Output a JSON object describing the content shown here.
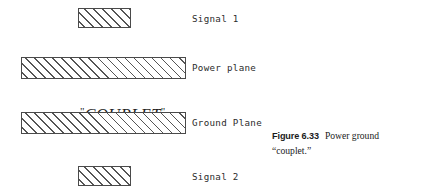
{
  "figure": {
    "layers": [
      {
        "name": "signal-1",
        "label": "Signal 1",
        "fill": "diagonal-hatch",
        "x": 78,
        "y": 8,
        "width": 53,
        "height": 20,
        "label_x": 192,
        "label_y": 13
      },
      {
        "name": "power-plane",
        "label": "Power plane",
        "fill": "diagonal-hatch",
        "x": 21,
        "y": 57,
        "width": 165,
        "height": 22,
        "label_x": 192,
        "label_y": 62
      },
      {
        "name": "ground-plane",
        "label": "Ground Plane",
        "fill": "diagonal-hatch",
        "x": 21,
        "y": 112,
        "width": 165,
        "height": 22,
        "label_x": 192,
        "label_y": 117
      },
      {
        "name": "signal-2",
        "label": "Signal 2",
        "fill": "diagonal-hatch",
        "x": 78,
        "y": 166,
        "width": 53,
        "height": 20,
        "label_x": 192,
        "label_y": 171
      }
    ],
    "callout": {
      "text": "COUPLET",
      "open_quote": "\"",
      "close_quote": "\"",
      "x": 62,
      "y": 85
    },
    "caption": {
      "figure_number": "Figure 6.33",
      "text_line_1": "Power ground",
      "text_line_2": "“couplet.”",
      "x": 272,
      "y": 129
    },
    "colors": {
      "background": "#ffffff",
      "ink": "#2b2b2b",
      "hatch": "#555555",
      "border": "#4a4a4a"
    }
  }
}
